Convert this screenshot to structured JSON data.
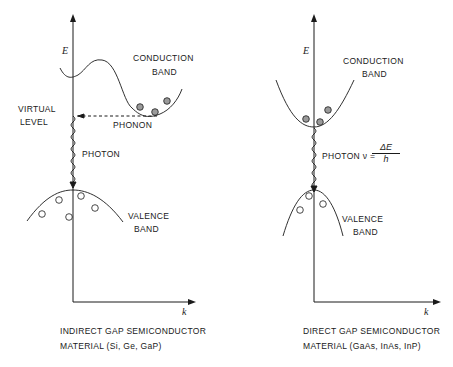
{
  "left_panel": {
    "axis_y_label": "E",
    "axis_x_label": "k",
    "conduction_band": [
      "CONDUCTION",
      "BAND"
    ],
    "virtual_level": [
      "VIRTUAL",
      "LEVEL"
    ],
    "phonon_label": "PHONON",
    "photon_label": "PHOTON",
    "valence_band": [
      "VALENCE",
      "BAND"
    ],
    "caption": [
      "INDIRECT  GAP  SEMICONDUCTOR",
      "MATERIAL  (Si, Ge, GaP)"
    ]
  },
  "right_panel": {
    "axis_y_label": "E",
    "axis_x_label": "k",
    "conduction_band": [
      "CONDUCTION",
      "BAND"
    ],
    "photon_label": "PHOTON  ν =",
    "formula_numerator": "ΔE",
    "formula_denominator": "h",
    "valence_band": [
      "VALENCE",
      "BAND"
    ],
    "caption": [
      "DIRECT  GAP  SEMICONDUCTOR",
      "MATERIAL  (GaAs, InAs, InP)"
    ]
  },
  "colors": {
    "ink": "#1a1a1a",
    "background": "#ffffff",
    "electron_fill": "#9a9a9a"
  }
}
